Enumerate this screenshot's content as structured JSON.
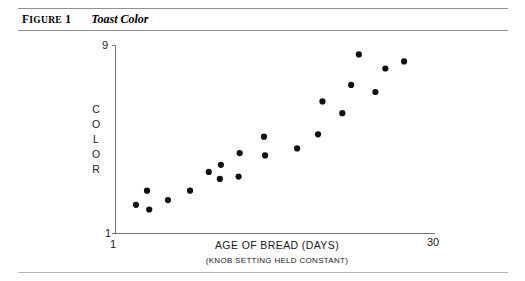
{
  "figure": {
    "label_prefix": "F",
    "label_rest": "IGURE",
    "label_number": "1",
    "title": "Toast Color"
  },
  "chart_data": {
    "type": "scatter",
    "title": "Toast Color",
    "xlabel": "AGE OF BREAD (DAYS)",
    "xlabel_sub": "(KNOB SETTING HELD CONSTANT)",
    "ylabel": "COLOR",
    "ylabel_letters": [
      "C",
      "O",
      "L",
      "O",
      "R"
    ],
    "xlim": [
      1,
      30
    ],
    "ylim": [
      1,
      9
    ],
    "xticks": [
      "1",
      "30"
    ],
    "yticks": [
      "1",
      "9"
    ],
    "grid": false,
    "legend": null,
    "points": [
      {
        "x": 2.9,
        "y": 2.2
      },
      {
        "x": 3.9,
        "y": 2.8
      },
      {
        "x": 4.1,
        "y": 2.0
      },
      {
        "x": 5.8,
        "y": 2.4
      },
      {
        "x": 7.8,
        "y": 2.8
      },
      {
        "x": 9.5,
        "y": 3.6
      },
      {
        "x": 10.6,
        "y": 3.9
      },
      {
        "x": 10.5,
        "y": 3.3
      },
      {
        "x": 12.2,
        "y": 3.4
      },
      {
        "x": 12.3,
        "y": 4.4
      },
      {
        "x": 14.5,
        "y": 5.1
      },
      {
        "x": 14.6,
        "y": 4.3
      },
      {
        "x": 17.5,
        "y": 4.6
      },
      {
        "x": 19.4,
        "y": 5.2
      },
      {
        "x": 19.8,
        "y": 6.6
      },
      {
        "x": 21.6,
        "y": 6.1
      },
      {
        "x": 22.4,
        "y": 7.3
      },
      {
        "x": 23.1,
        "y": 8.6
      },
      {
        "x": 24.6,
        "y": 7.0
      },
      {
        "x": 25.5,
        "y": 8.0
      },
      {
        "x": 27.2,
        "y": 8.3
      }
    ]
  }
}
